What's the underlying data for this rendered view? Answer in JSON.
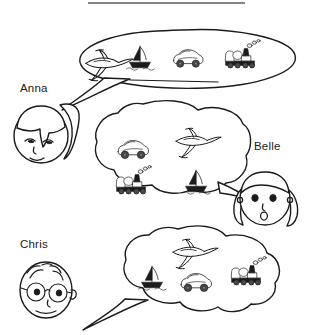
{
  "figure": {
    "title_rule": "horizontal-rule",
    "background_color": "#ffffff",
    "ink_color": "#1b1b1b"
  },
  "people": [
    {
      "id": "anna",
      "name": "Anna",
      "label_x": 20,
      "label_y": 92,
      "face": "girl-with-ponytail",
      "bubble": "top-ellipse-bubble"
    },
    {
      "id": "belle",
      "name": "Belle",
      "label_x": 254,
      "label_y": 150,
      "face": "girl-with-pigtails",
      "bubble": "middle-cloud-bubble"
    },
    {
      "id": "chris",
      "name": "Chris",
      "label_x": 20,
      "label_y": 248,
      "face": "boy-with-glasses",
      "bubble": "bottom-cloud-bubble"
    }
  ],
  "bubbles": [
    {
      "id": "anna-bubble",
      "owner": "Anna",
      "shape": "ellipse",
      "tail_direction": "down-left",
      "items": [
        "airplane",
        "sailboat",
        "car",
        "train"
      ]
    },
    {
      "id": "belle-bubble",
      "owner": "Belle",
      "shape": "cloud",
      "tail_direction": "down-right",
      "items": [
        "car",
        "train",
        "airplane",
        "sailboat"
      ]
    },
    {
      "id": "chris-bubble",
      "owner": "Chris",
      "shape": "cloud",
      "tail_direction": "down-left",
      "items": [
        "airplane",
        "sailboat",
        "car",
        "train"
      ]
    }
  ],
  "icons": {
    "airplane": "airplane-icon",
    "sailboat": "sailboat-icon",
    "car": "car-icon",
    "train": "train-icon"
  }
}
